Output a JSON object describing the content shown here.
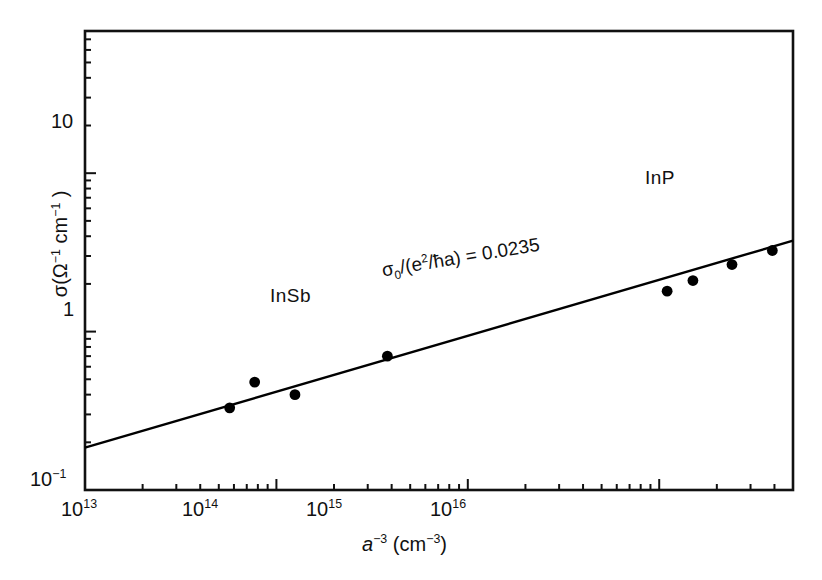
{
  "chart_data": {
    "type": "scatter",
    "title": "",
    "xlabel": "a^-3 (cm^-3)",
    "ylabel": "sigma (Ohm^-1 cm^-1)",
    "xscale": "log",
    "yscale": "log",
    "xlim": [
      10000000000000.0,
      5e+16
    ],
    "ylim": [
      0.1,
      79.0
    ],
    "grid": false,
    "legend": "none",
    "x": [
      57000000000000.0,
      77000000000000.0,
      125000000000000.0,
      380000000000000.0,
      1.1e+16,
      1.5e+16,
      2.4e+16,
      3.9e+16
    ],
    "values": [
      0.33,
      0.48,
      0.4,
      0.7,
      1.8,
      2.1,
      2.65,
      3.25
    ],
    "series": [
      {
        "name": "conductivity data",
        "marker": "filled-circle",
        "points": [
          {
            "x": 57000000000000.0,
            "y": 0.33
          },
          {
            "x": 77000000000000.0,
            "y": 0.48
          },
          {
            "x": 125000000000000.0,
            "y": 0.4
          },
          {
            "x": 380000000000000.0,
            "y": 0.7
          },
          {
            "x": 1.1e+16,
            "y": 1.8
          },
          {
            "x": 1.5e+16,
            "y": 2.1
          },
          {
            "x": 2.4e+16,
            "y": 2.65
          },
          {
            "x": 3.9e+16,
            "y": 3.25
          }
        ]
      },
      {
        "name": "fit line",
        "marker": "line",
        "points": [
          {
            "x": 10000000000000.0,
            "y": 0.185
          },
          {
            "x": 5e+16,
            "y": 3.75
          }
        ]
      }
    ],
    "xticks": [
      {
        "value": 10000000000000.0,
        "label": "10",
        "exponent": "13"
      },
      {
        "value": 100000000000000.0,
        "label": "10",
        "exponent": "14"
      },
      {
        "value": 1000000000000000.0,
        "label": "10",
        "exponent": "15"
      },
      {
        "value": 1e+16,
        "label": "10",
        "exponent": "16"
      }
    ],
    "yticks": [
      {
        "value": 0.1,
        "label": "10",
        "exponent": "-1"
      },
      {
        "value": 1,
        "label": "1",
        "exponent": ""
      },
      {
        "value": 10,
        "label": "10",
        "exponent": ""
      }
    ],
    "annotations": [
      {
        "name": "sigma0-ratio",
        "text": "σ₀/(e²/ħa) = 0.0235",
        "x": 1400000000000000.0,
        "y": 1.05
      },
      {
        "name": "material-insb",
        "text": "InSb",
        "x": 160000000000000.0,
        "y": 1.0
      },
      {
        "name": "material-inp",
        "text": "InP",
        "x": 6000000000000000.0,
        "y": 4.2
      }
    ]
  },
  "axes": {
    "x_title": {
      "base": "a",
      "base_exp": "−3",
      "unit_open": " (cm",
      "unit_exp": "−3",
      "unit_close": ")"
    },
    "y_title": {
      "sigma": "σ(Ω",
      "sigma_exp": "−1",
      "cm": " cm",
      "cm_exp": "−1",
      "close": " )"
    }
  },
  "ticklabels": {
    "x": [
      {
        "mantissa": "10",
        "exp": "13"
      },
      {
        "mantissa": "10",
        "exp": "14"
      },
      {
        "mantissa": "10",
        "exp": "15"
      },
      {
        "mantissa": "10",
        "exp": "16"
      }
    ],
    "y": [
      {
        "mantissa": "10",
        "exp": "−1"
      },
      {
        "mantissa": "1",
        "exp": ""
      },
      {
        "mantissa": "10",
        "exp": ""
      }
    ]
  },
  "labels": {
    "insb": "InSb",
    "inp": "InP",
    "annotation_sigma": "σ",
    "annotation_sub": "0",
    "annotation_mid": "/(e",
    "annotation_sup": "2",
    "annotation_tail": "/ħa) = 0.0235"
  },
  "colors": {
    "ink": "#111111",
    "background": "#ffffff",
    "marker": "#000000",
    "line": "#000000"
  }
}
